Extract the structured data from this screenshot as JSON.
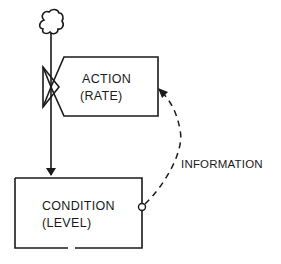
{
  "diagram": {
    "source": {
      "icon": "cloud-icon"
    },
    "rate_node": {
      "line1": "ACTION",
      "line2": "(RATE)"
    },
    "level_node": {
      "line1": "CONDITION",
      "line2": "(LEVEL)"
    },
    "information_link": {
      "label": "INFORMATION"
    },
    "colors": {
      "ink": "#1a1a1a",
      "background": "#ffffff"
    }
  }
}
